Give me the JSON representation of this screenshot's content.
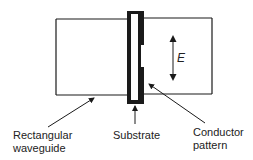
{
  "diagram": {
    "type": "waveguide cross-section schematic",
    "labels": {
      "rectangular_waveguide_line1": "Rectangular",
      "rectangular_waveguide_line2": "waveguide",
      "substrate": "Substrate",
      "conductor_pattern_line1": "Conductor",
      "conductor_pattern_line2": "pattern",
      "field": "E"
    },
    "components": [
      {
        "name": "Rectangular waveguide",
        "shape": "rectangle"
      },
      {
        "name": "Substrate",
        "shape": "thin vertical slab"
      },
      {
        "name": "Conductor pattern",
        "shape": "thick segments on substrate edge with central gap"
      },
      {
        "name": "E field",
        "shape": "double-headed vertical arrow"
      }
    ],
    "colors": {
      "stroke": "#1a1a1a",
      "background": "#ffffff"
    }
  }
}
